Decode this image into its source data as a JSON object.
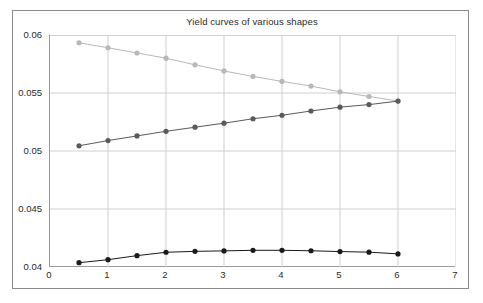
{
  "chart_data": {
    "type": "line",
    "title": "Yield curves of various shapes",
    "xlabel": "",
    "ylabel": "",
    "xlim": [
      0,
      7
    ],
    "ylim": [
      0.04,
      0.06
    ],
    "xticks": [
      "0",
      "1",
      "2",
      "3",
      "4",
      "5",
      "6",
      "7"
    ],
    "xtick_values": [
      0,
      1,
      2,
      3,
      4,
      5,
      6,
      7
    ],
    "yticks": [
      "0.04",
      "0.045",
      "0.05",
      "0.055",
      "0.06"
    ],
    "ytick_values": [
      0.04,
      0.045,
      0.05,
      0.055,
      0.06
    ],
    "grid": true,
    "legend": "none",
    "markers": "filled-circle",
    "x": [
      0.5,
      1.0,
      1.5,
      2.0,
      2.5,
      3.0,
      3.5,
      4.0,
      4.5,
      5.0,
      5.5,
      6.0
    ],
    "series": [
      {
        "name": "inverted",
        "color": "#b8b8b8",
        "values": [
          0.05933,
          0.0589,
          0.05845,
          0.058,
          0.05743,
          0.0569,
          0.05643,
          0.056,
          0.0556,
          0.0551,
          0.0547,
          0.0543
        ]
      },
      {
        "name": "normal",
        "color": "#5a5a5a",
        "values": [
          0.05045,
          0.0509,
          0.0513,
          0.0517,
          0.05205,
          0.0524,
          0.05278,
          0.05308,
          0.05345,
          0.05378,
          0.054,
          0.0543
        ]
      },
      {
        "name": "humped",
        "color": "#1a1a1a",
        "values": [
          0.04037,
          0.04063,
          0.04098,
          0.04127,
          0.04135,
          0.04139,
          0.04144,
          0.04144,
          0.0414,
          0.04133,
          0.04128,
          0.04113
        ]
      }
    ]
  }
}
